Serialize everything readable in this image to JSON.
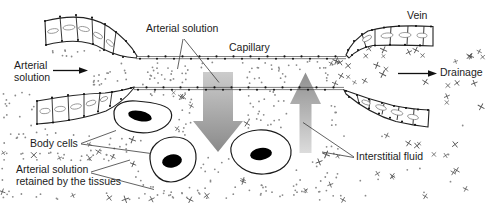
{
  "labels": {
    "arterial_solution_top": "Arterial solution",
    "capillary": "Capillary",
    "vein": "Vein",
    "arterial_solution_left": {
      "line1": "Arterial",
      "line2": "solution"
    },
    "drainage": "Drainage",
    "body_cells": "Body cells",
    "retained": {
      "line1": "Arterial solution",
      "line2": "retained by the tissues"
    },
    "interstitial_fluid": "Interstitial fluid"
  },
  "colors": {
    "background": "#ffffff",
    "line": "#222222",
    "text": "#1c1c1c",
    "dot": "#8a8a8a",
    "cross": "#555555",
    "arrow_gray_light": "#cccccc",
    "arrow_gray_dark": "#8a8a8a"
  }
}
